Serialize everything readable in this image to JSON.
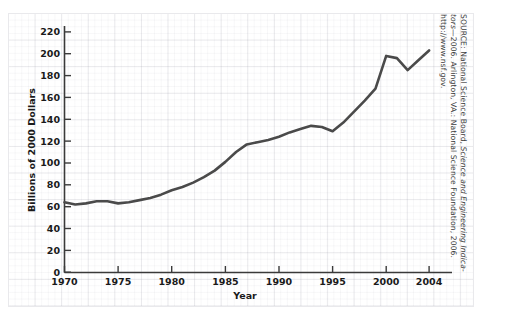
{
  "chart_data": {
    "type": "line",
    "title": "",
    "xlabel": "Year",
    "ylabel": "Billions of 2000 Dollars",
    "xlim": [
      1970,
      2005
    ],
    "ylim": [
      0,
      228
    ],
    "grid": "faint graph-paper background grid",
    "legend": "none",
    "x_ticks": [
      "1970",
      "1975",
      "1980",
      "1985",
      "1990",
      "1995",
      "2000",
      "2004"
    ],
    "y_ticks": [
      "0",
      "20",
      "40",
      "60",
      "80",
      "100",
      "120",
      "140",
      "160",
      "180",
      "200",
      "220"
    ],
    "series": [
      {
        "name": "Federal R&D funding",
        "color": "#4a4a4a",
        "x": [
          1970,
          1971,
          1972,
          1973,
          1974,
          1975,
          1976,
          1977,
          1978,
          1979,
          1980,
          1981,
          1982,
          1983,
          1984,
          1985,
          1986,
          1987,
          1988,
          1989,
          1990,
          1991,
          1992,
          1993,
          1994,
          1995,
          1996,
          1997,
          1998,
          1999,
          2000,
          2001,
          2002,
          2003,
          2004
        ],
        "values": [
          64,
          62,
          63,
          65,
          65,
          63,
          64,
          66,
          68,
          71,
          75,
          78,
          82,
          87,
          93,
          101,
          110,
          117,
          119,
          121,
          124,
          128,
          131,
          134,
          133,
          129,
          137,
          147,
          157,
          168,
          198,
          196,
          185,
          194,
          203
        ]
      }
    ]
  },
  "axes": {
    "y_title": "Billions of 2000 Dollars",
    "x_title": "Year"
  },
  "source_note": {
    "line1_prefix": "SOURCE: National Science Board, ",
    "line1_italic": "Science and Engineering Indica-",
    "line2_italic": "tors",
    "line2_rest": "—2006. Arlington, VA.: National Science Foundation, 2006.",
    "line3": "http://www.nsf.gov."
  }
}
